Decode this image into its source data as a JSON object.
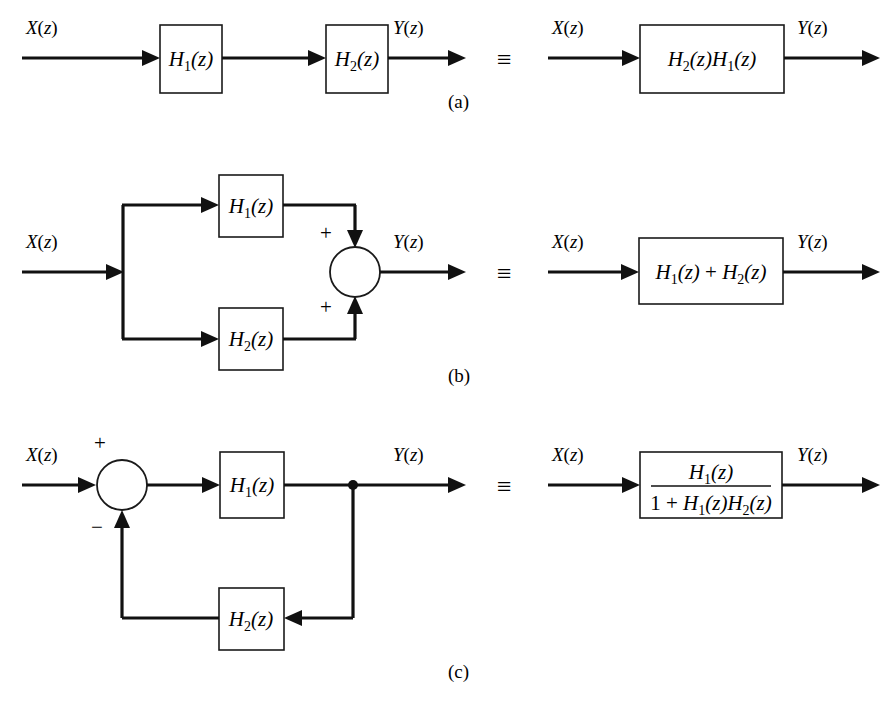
{
  "figure": {
    "background_color": "#ffffff",
    "line_color": "#111111",
    "equivalence_symbol": "≡",
    "signals": {
      "input": "X(z)",
      "output": "Y(z)"
    },
    "blocks": {
      "h1": "H₁(z)",
      "h2": "H₂(z)",
      "cascade": "H₂(z)H₁(z)",
      "parallel": "H₁(z) + H₂(z)",
      "feedback_numerator": "H₁(z)",
      "feedback_denominator": "1 + H₁(z)H₂(z)"
    },
    "signs": {
      "plus": "+",
      "minus": "−"
    },
    "panels": [
      {
        "id": "a",
        "label": "(a)",
        "caption": "Cascade connection",
        "left_side": {
          "input_label": "X(z)",
          "output_label": "Y(z)",
          "blocks": [
            "H₁(z)",
            "H₂(z)"
          ]
        },
        "right_side": {
          "input_label": "X(z)",
          "output_label": "Y(z)",
          "blocks": [
            "H₂(z)H₁(z)"
          ]
        }
      },
      {
        "id": "b",
        "label": "(b)",
        "caption": "Parallel connection",
        "left_side": {
          "input_label": "X(z)",
          "output_label": "Y(z)",
          "blocks": [
            "H₁(z)",
            "H₂(z)"
          ],
          "summer_signs": [
            "+",
            "+"
          ]
        },
        "right_side": {
          "input_label": "X(z)",
          "output_label": "Y(z)",
          "blocks": [
            "H₁(z) + H₂(z)"
          ]
        }
      },
      {
        "id": "c",
        "label": "(c)",
        "caption": "Feedback connection",
        "left_side": {
          "input_label": "X(z)",
          "output_label": "Y(z)",
          "blocks": [
            "H₁(z)",
            "H₂(z)"
          ],
          "summer_signs": [
            "+",
            "−"
          ]
        },
        "right_side": {
          "input_label": "X(z)",
          "output_label": "Y(z)",
          "blocks": [
            "H₁(z) / (1 + H₁(z)H₂(z))"
          ]
        }
      }
    ],
    "glyphs": {
      "H": "H",
      "z": "z",
      "one": "1",
      "plus": "+",
      "sub1": "1",
      "sub2": "2",
      "lparen": "(",
      "rparen": ")"
    }
  }
}
